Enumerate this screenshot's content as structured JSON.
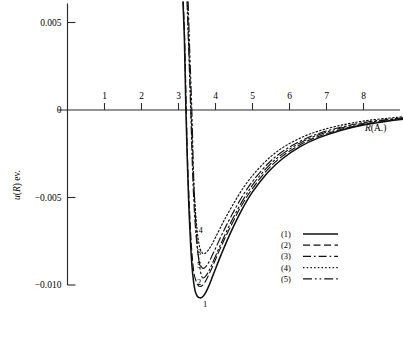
{
  "chart_data": {
    "type": "line",
    "title": "",
    "xlabel": "R(A.)",
    "ylabel": "u(R) ev.",
    "xlim": [
      0,
      9.1
    ],
    "ylim": [
      -0.0115,
      0.0062
    ],
    "grid": false,
    "legend_position": "lower-right",
    "xticks": [
      1,
      2,
      3,
      4,
      5,
      6,
      7,
      8
    ],
    "xtick_labels": [
      "1",
      "2",
      "3",
      "4",
      "5",
      "6",
      "7",
      "8"
    ],
    "yticks": [
      0.005,
      0,
      -0.005,
      -0.01
    ],
    "ytick_labels": [
      "0.005",
      "0",
      "−0.005",
      "−0.010"
    ],
    "series": [
      {
        "name": "(1)",
        "label": "1",
        "style": "solid",
        "zero_crossing": 3.2,
        "minimum": {
          "x": 3.62,
          "y": -0.01072
        },
        "points": [
          [
            3.12,
            0.0062
          ],
          [
            3.16,
            0.004
          ],
          [
            3.2,
            0.0
          ],
          [
            3.24,
            -0.003
          ],
          [
            3.28,
            -0.0055
          ],
          [
            3.33,
            -0.0078
          ],
          [
            3.38,
            -0.0093
          ],
          [
            3.44,
            -0.01025
          ],
          [
            3.5,
            -0.01062
          ],
          [
            3.56,
            -0.01072
          ],
          [
            3.62,
            -0.01072
          ],
          [
            3.7,
            -0.01055
          ],
          [
            3.8,
            -0.01015
          ],
          [
            3.95,
            -0.00935
          ],
          [
            4.15,
            -0.00828
          ],
          [
            4.4,
            -0.00705
          ],
          [
            4.7,
            -0.00575
          ],
          [
            5.0,
            -0.00468
          ],
          [
            5.4,
            -0.0036
          ],
          [
            5.8,
            -0.0028
          ],
          [
            6.3,
            -0.00208
          ],
          [
            6.8,
            -0.00158
          ],
          [
            7.4,
            -0.00115
          ],
          [
            8.0,
            -0.00085
          ],
          [
            8.6,
            -0.00065
          ],
          [
            9.1,
            -0.00052
          ]
        ]
      },
      {
        "name": "(2)",
        "label": "2",
        "style": "dashed",
        "zero_crossing": 3.2,
        "minimum": {
          "x": 3.6,
          "y": -0.01008
        },
        "points": [
          [
            3.13,
            0.0062
          ],
          [
            3.17,
            0.0038
          ],
          [
            3.21,
            0.0
          ],
          [
            3.25,
            -0.0032
          ],
          [
            3.3,
            -0.0058
          ],
          [
            3.35,
            -0.0078
          ],
          [
            3.41,
            -0.0092
          ],
          [
            3.47,
            -0.00975
          ],
          [
            3.53,
            -0.01002
          ],
          [
            3.6,
            -0.01008
          ],
          [
            3.68,
            -0.00995
          ],
          [
            3.78,
            -0.00958
          ],
          [
            3.92,
            -0.00895
          ],
          [
            4.12,
            -0.00795
          ],
          [
            4.38,
            -0.00678
          ],
          [
            4.68,
            -0.00555
          ],
          [
            5.0,
            -0.00448
          ],
          [
            5.4,
            -0.00342
          ],
          [
            5.8,
            -0.00265
          ],
          [
            6.3,
            -0.00197
          ],
          [
            6.8,
            -0.0015
          ],
          [
            7.4,
            -0.0011
          ],
          [
            8.0,
            -0.00082
          ],
          [
            8.6,
            -0.00063
          ],
          [
            9.1,
            -0.0005
          ]
        ]
      },
      {
        "name": "(3)",
        "label": "3",
        "style": "dashdot",
        "zero_crossing": 3.33,
        "minimum": {
          "x": 3.66,
          "y": -0.00905
        },
        "points": [
          [
            3.23,
            0.0062
          ],
          [
            3.27,
            0.0038
          ],
          [
            3.33,
            0.0
          ],
          [
            3.38,
            -0.0035
          ],
          [
            3.43,
            -0.0058
          ],
          [
            3.48,
            -0.0073
          ],
          [
            3.54,
            -0.0084
          ],
          [
            3.6,
            -0.00888
          ],
          [
            3.66,
            -0.00905
          ],
          [
            3.74,
            -0.00895
          ],
          [
            3.84,
            -0.00862
          ],
          [
            3.98,
            -0.008
          ],
          [
            4.18,
            -0.00708
          ],
          [
            4.44,
            -0.006
          ],
          [
            4.74,
            -0.00488
          ],
          [
            5.05,
            -0.00395
          ],
          [
            5.45,
            -0.003
          ],
          [
            5.85,
            -0.00232
          ],
          [
            6.35,
            -0.00172
          ],
          [
            6.85,
            -0.0013
          ],
          [
            7.45,
            -0.00095
          ],
          [
            8.05,
            -0.0007
          ],
          [
            8.65,
            -0.00054
          ],
          [
            9.1,
            -0.00044
          ]
        ]
      },
      {
        "name": "(4)",
        "label": "4",
        "style": "dotted",
        "zero_crossing": 3.33,
        "minimum": {
          "x": 3.68,
          "y": -0.00822
        },
        "points": [
          [
            3.24,
            0.0062
          ],
          [
            3.28,
            0.0036
          ],
          [
            3.34,
            0.0
          ],
          [
            3.39,
            -0.0032
          ],
          [
            3.45,
            -0.0055
          ],
          [
            3.51,
            -0.007
          ],
          [
            3.57,
            -0.00782
          ],
          [
            3.63,
            -0.00812
          ],
          [
            3.68,
            -0.00822
          ],
          [
            3.76,
            -0.00812
          ],
          [
            3.87,
            -0.0078
          ],
          [
            4.02,
            -0.0072
          ],
          [
            4.22,
            -0.00636
          ],
          [
            4.48,
            -0.00538
          ],
          [
            4.78,
            -0.00436
          ],
          [
            5.1,
            -0.0035
          ],
          [
            5.5,
            -0.00265
          ],
          [
            5.9,
            -0.00204
          ],
          [
            6.4,
            -0.0015
          ],
          [
            6.9,
            -0.00113
          ],
          [
            7.5,
            -0.00082
          ],
          [
            8.1,
            -0.0006
          ],
          [
            8.7,
            -0.00046
          ],
          [
            9.1,
            -0.00038
          ]
        ]
      },
      {
        "name": "(5)",
        "label": "5",
        "style": "dashdotdot",
        "zero_crossing": 3.36,
        "minimum": {
          "x": 3.66,
          "y": -0.0096
        },
        "points": [
          [
            3.26,
            0.0062
          ],
          [
            3.3,
            0.0036
          ],
          [
            3.36,
            0.0
          ],
          [
            3.41,
            -0.0038
          ],
          [
            3.46,
            -0.0062
          ],
          [
            3.52,
            -0.008
          ],
          [
            3.58,
            -0.00905
          ],
          [
            3.62,
            -0.00945
          ],
          [
            3.66,
            -0.0096
          ],
          [
            3.74,
            -0.00948
          ],
          [
            3.84,
            -0.00912
          ],
          [
            3.98,
            -0.00845
          ],
          [
            4.18,
            -0.00748
          ],
          [
            4.44,
            -0.00632
          ],
          [
            4.74,
            -0.00515
          ],
          [
            5.05,
            -0.00415
          ],
          [
            5.45,
            -0.00316
          ],
          [
            5.85,
            -0.00245
          ],
          [
            6.35,
            -0.00181
          ],
          [
            6.85,
            -0.00137
          ],
          [
            7.45,
            -0.001
          ],
          [
            8.05,
            -0.00074
          ],
          [
            8.65,
            -0.00057
          ],
          [
            9.1,
            -0.00046
          ]
        ]
      }
    ],
    "curve_end_labels": [
      {
        "text": "1",
        "x": 3.72,
        "y": -0.01128
      },
      {
        "text": "2",
        "x": 3.56,
        "y": -0.01
      },
      {
        "text": "5",
        "x": 3.56,
        "y": -0.009
      },
      {
        "text": "3",
        "x": 3.56,
        "y": -0.0083
      },
      {
        "text": "4",
        "x": 3.6,
        "y": -0.007
      }
    ]
  },
  "legend": {
    "items": [
      {
        "label": "(1)",
        "style": "solid"
      },
      {
        "label": "(2)",
        "style": "dashed"
      },
      {
        "label": "(3)",
        "style": "dashdot"
      },
      {
        "label": "(4)",
        "style": "dotted"
      },
      {
        "label": "(5)",
        "style": "dashdotdot"
      }
    ]
  }
}
